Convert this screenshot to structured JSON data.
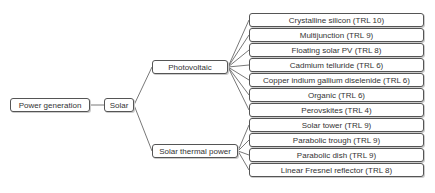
{
  "diagram": {
    "type": "tree",
    "root": {
      "label": "Power generation"
    },
    "level1": {
      "label": "Solar"
    },
    "branches": [
      {
        "label": "Photovoltaic",
        "children": [
          "Crystalline silicon (TRL 10)",
          "Multijunction (TRL 9)",
          "Floating solar PV (TRL 8)",
          "Cadmium telluride (TRL 6)",
          "Copper indium gallium diselenide (TRL 6)",
          "Organic (TRL 6)",
          "Perovskites (TRL 4)"
        ]
      },
      {
        "label": "Solar thermal power",
        "children": [
          "Solar tower (TRL 9)",
          "Parabolic trough (TRL 9)",
          "Parabolic dish (TRL 9)",
          "Linear Fresnel reflector (TRL 8)"
        ]
      }
    ],
    "colors": {
      "border": "#555555",
      "line": "#555555",
      "text": "#333333",
      "background": "#ffffff"
    }
  }
}
